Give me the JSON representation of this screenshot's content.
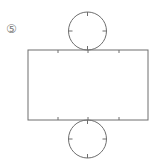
{
  "figure": {
    "label": "⑤",
    "stroke_color": "#6e6e6e",
    "top_circle": {
      "cx": 87.5,
      "cy": 31,
      "r": 19
    },
    "rectangle": {
      "x": 28,
      "y": 50,
      "width": 120,
      "height": 70
    },
    "bottom_circle": {
      "cx": 87.5,
      "cy": 139,
      "r": 19
    },
    "rect_ticks_x": [
      58,
      88,
      119
    ]
  }
}
